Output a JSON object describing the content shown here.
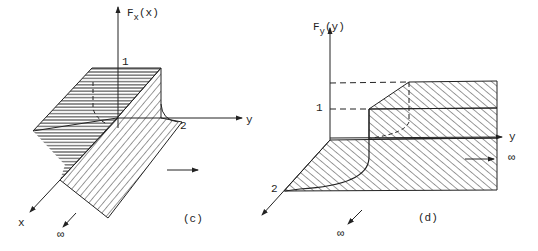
{
  "panel_c": {
    "caption": "(c)",
    "z_axis_label_main": "F",
    "z_axis_label_sub": "x",
    "z_axis_label_arg": "(x)",
    "level_one": "1",
    "y_tick_two": "2",
    "y_axis_label": "y",
    "x_axis_label": "x",
    "infinity": "∞"
  },
  "panel_d": {
    "caption": "(d)",
    "z_axis_label_main": "F",
    "z_axis_label_sub": "y",
    "z_axis_label_arg": "(y)",
    "level_one": "1",
    "x_tick_two": "2",
    "y_axis_label": "y",
    "infinity_right": "∞",
    "infinity_bottom": "∞"
  },
  "colors": {
    "ink": "#222222",
    "background": "#ffffff"
  }
}
